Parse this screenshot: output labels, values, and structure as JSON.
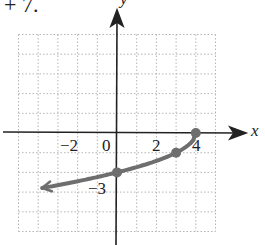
{
  "header_fragment": "+ 7.",
  "chart_data": {
    "type": "line",
    "title": "",
    "xlabel": "x",
    "ylabel": "y",
    "function": "y = -sqrt(4 - x)",
    "xlim": [
      -5,
      5
    ],
    "ylim": [
      -5,
      5
    ],
    "grid": true,
    "tick_labels_x": [
      "-2",
      "0",
      "2",
      "4"
    ],
    "tick_labels_y": [
      "-3"
    ],
    "highlighted_points": [
      {
        "x": 4,
        "y": 0
      },
      {
        "x": 3,
        "y": -1
      },
      {
        "x": 0,
        "y": -2
      }
    ],
    "curve_samples": [
      {
        "x": 4,
        "y": 0
      },
      {
        "x": 3.75,
        "y": -0.5
      },
      {
        "x": 3,
        "y": -1
      },
      {
        "x": 2,
        "y": -1.41
      },
      {
        "x": 1,
        "y": -1.73
      },
      {
        "x": 0,
        "y": -2
      },
      {
        "x": -1,
        "y": -2.24
      },
      {
        "x": -2,
        "y": -2.45
      },
      {
        "x": -3,
        "y": -2.65
      },
      {
        "x": -3.8,
        "y": -2.79
      }
    ],
    "arrow_end": "lower-left",
    "colors": {
      "curve": "#6e6e6e",
      "axes": "#222222",
      "grid": "#b5b5b5"
    }
  },
  "labels": {
    "x_axis": "x",
    "y_axis": "y",
    "tick_m2": "−2",
    "tick_0": "0",
    "tick_2": "2",
    "tick_4": "4",
    "tick_m3": "−3"
  }
}
